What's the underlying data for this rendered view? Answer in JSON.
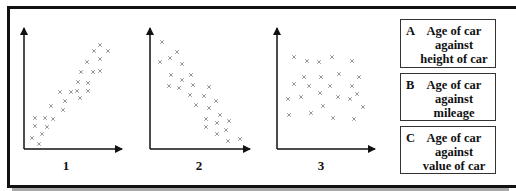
{
  "graphs": [
    {
      "label": "1",
      "origin": [
        24,
        149
      ],
      "y_top": 28,
      "x_right": 122,
      "label_pos": [
        56,
        160
      ],
      "trend": "positive",
      "points": [
        [
          100,
          45
        ],
        [
          94,
          51
        ],
        [
          108,
          51
        ],
        [
          100,
          59
        ],
        [
          87,
          62
        ],
        [
          81,
          72
        ],
        [
          93,
          72
        ],
        [
          100,
          71
        ],
        [
          78,
          82
        ],
        [
          88,
          83
        ],
        [
          77,
          91
        ],
        [
          71,
          92
        ],
        [
          60,
          92
        ],
        [
          65,
          101
        ],
        [
          88,
          91
        ],
        [
          80,
          98
        ],
        [
          51,
          106
        ],
        [
          63,
          110
        ],
        [
          35,
          118
        ],
        [
          45,
          118
        ],
        [
          53,
          119
        ],
        [
          35,
          126
        ],
        [
          47,
          127
        ],
        [
          42,
          134
        ],
        [
          32,
          138
        ],
        [
          39,
          144
        ]
      ]
    },
    {
      "label": "2",
      "origin": [
        150,
        149
      ],
      "y_top": 28,
      "x_right": 250,
      "label_pos": [
        189,
        160
      ],
      "trend": "negative",
      "points": [
        [
          162,
          42
        ],
        [
          177,
          52
        ],
        [
          170,
          58
        ],
        [
          160,
          62
        ],
        [
          182,
          64
        ],
        [
          171,
          75
        ],
        [
          191,
          75
        ],
        [
          182,
          80
        ],
        [
          169,
          86
        ],
        [
          179,
          88
        ],
        [
          193,
          85
        ],
        [
          209,
          87
        ],
        [
          190,
          95
        ],
        [
          204,
          96
        ],
        [
          216,
          101
        ],
        [
          196,
          105
        ],
        [
          209,
          108
        ],
        [
          220,
          115
        ],
        [
          206,
          119
        ],
        [
          217,
          123
        ],
        [
          229,
          121
        ],
        [
          206,
          127
        ],
        [
          226,
          130
        ],
        [
          217,
          134
        ],
        [
          228,
          141
        ],
        [
          240,
          139
        ]
      ]
    },
    {
      "label": "3",
      "origin": [
        277,
        149
      ],
      "y_top": 28,
      "x_right": 375,
      "label_pos": [
        311,
        160
      ],
      "trend": "none",
      "points": [
        [
          294,
          57
        ],
        [
          307,
          61
        ],
        [
          319,
          62
        ],
        [
          332,
          57
        ],
        [
          352,
          61
        ],
        [
          304,
          77
        ],
        [
          321,
          77
        ],
        [
          339,
          74
        ],
        [
          359,
          77
        ],
        [
          294,
          84
        ],
        [
          309,
          86
        ],
        [
          330,
          86
        ],
        [
          352,
          86
        ],
        [
          357,
          94
        ],
        [
          288,
          99
        ],
        [
          301,
          97
        ],
        [
          320,
          93
        ],
        [
          338,
          97
        ],
        [
          350,
          99
        ],
        [
          363,
          107
        ],
        [
          289,
          115
        ],
        [
          311,
          113
        ],
        [
          323,
          106
        ],
        [
          333,
          118
        ],
        [
          354,
          119
        ]
      ]
    }
  ],
  "options": [
    {
      "letter": "A",
      "lines": [
        "Age of car",
        "against",
        "height of car"
      ],
      "top": 19,
      "height": 49
    },
    {
      "letter": "B",
      "lines": [
        "Age of car",
        "against",
        "mileage"
      ],
      "top": 73,
      "height": 48
    },
    {
      "letter": "C",
      "lines": [
        "Age of car",
        "against",
        "value of car"
      ],
      "top": 126,
      "height": 48
    }
  ],
  "colors": {
    "axis": "#111111",
    "marker": "#8a8a8a",
    "frame": "#111111",
    "shadow": "#a8a8a8"
  },
  "chart_data": [
    {
      "type": "scatter",
      "title": "1",
      "xlabel": "",
      "ylabel": "",
      "description": "Strong positive correlation",
      "x": [
        0.78,
        0.71,
        0.86,
        0.78,
        0.64,
        0.58,
        0.7,
        0.78,
        0.55,
        0.65,
        0.54,
        0.48,
        0.37,
        0.42,
        0.65,
        0.57,
        0.28,
        0.4,
        0.11,
        0.22,
        0.3,
        0.11,
        0.23,
        0.18,
        0.08,
        0.15
      ],
      "y": [
        0.86,
        0.81,
        0.81,
        0.74,
        0.72,
        0.64,
        0.64,
        0.64,
        0.55,
        0.55,
        0.48,
        0.47,
        0.47,
        0.4,
        0.48,
        0.42,
        0.36,
        0.32,
        0.26,
        0.26,
        0.25,
        0.19,
        0.18,
        0.12,
        0.09,
        0.04
      ]
    },
    {
      "type": "scatter",
      "title": "2",
      "xlabel": "",
      "ylabel": "",
      "description": "Strong negative correlation",
      "x": [
        0.12,
        0.27,
        0.2,
        0.1,
        0.32,
        0.21,
        0.41,
        0.32,
        0.19,
        0.29,
        0.43,
        0.59,
        0.4,
        0.54,
        0.66,
        0.46,
        0.59,
        0.7,
        0.56,
        0.67,
        0.79,
        0.56,
        0.76,
        0.67,
        0.78,
        0.9
      ],
      "y": [
        0.88,
        0.8,
        0.75,
        0.72,
        0.7,
        0.61,
        0.61,
        0.57,
        0.52,
        0.5,
        0.53,
        0.51,
        0.45,
        0.44,
        0.4,
        0.36,
        0.34,
        0.28,
        0.25,
        0.21,
        0.23,
        0.18,
        0.16,
        0.12,
        0.07,
        0.08
      ]
    },
    {
      "type": "scatter",
      "title": "3",
      "xlabel": "",
      "ylabel": "",
      "description": "No correlation",
      "x": [
        0.17,
        0.31,
        0.43,
        0.56,
        0.77,
        0.28,
        0.45,
        0.63,
        0.84,
        0.17,
        0.33,
        0.54,
        0.77,
        0.82,
        0.11,
        0.24,
        0.44,
        0.62,
        0.74,
        0.88,
        0.12,
        0.35,
        0.47,
        0.57,
        0.79
      ],
      "y": [
        0.76,
        0.73,
        0.72,
        0.76,
        0.73,
        0.6,
        0.6,
        0.62,
        0.6,
        0.54,
        0.52,
        0.52,
        0.52,
        0.45,
        0.41,
        0.43,
        0.46,
        0.43,
        0.41,
        0.35,
        0.28,
        0.3,
        0.35,
        0.26,
        0.25
      ]
    }
  ]
}
